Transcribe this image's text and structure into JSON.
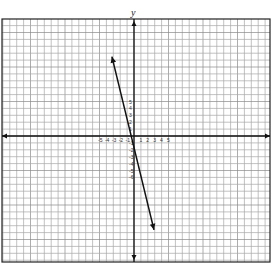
{
  "chart_data": {
    "type": "line",
    "title": "",
    "xlabel": "",
    "ylabel": "y",
    "grid": true,
    "xlim": [
      -19,
      19
    ],
    "ylim": [
      -18,
      17
    ],
    "x_tick_labels": [
      "-5",
      "-4",
      "-3",
      "-2",
      "-1",
      "1",
      "2",
      "3",
      "4",
      "5"
    ],
    "y_tick_labels": [
      "5",
      "4",
      "3",
      "2",
      "1",
      "-1",
      "-2",
      "-3",
      "-4",
      "-5",
      "-6"
    ],
    "series": [
      {
        "name": "line",
        "points": [
          [
            -3.2,
            11.5
          ],
          [
            2.9,
            -13.6
          ]
        ],
        "arrows_both_ends": true
      }
    ]
  },
  "axis": {
    "y_label": "y"
  }
}
